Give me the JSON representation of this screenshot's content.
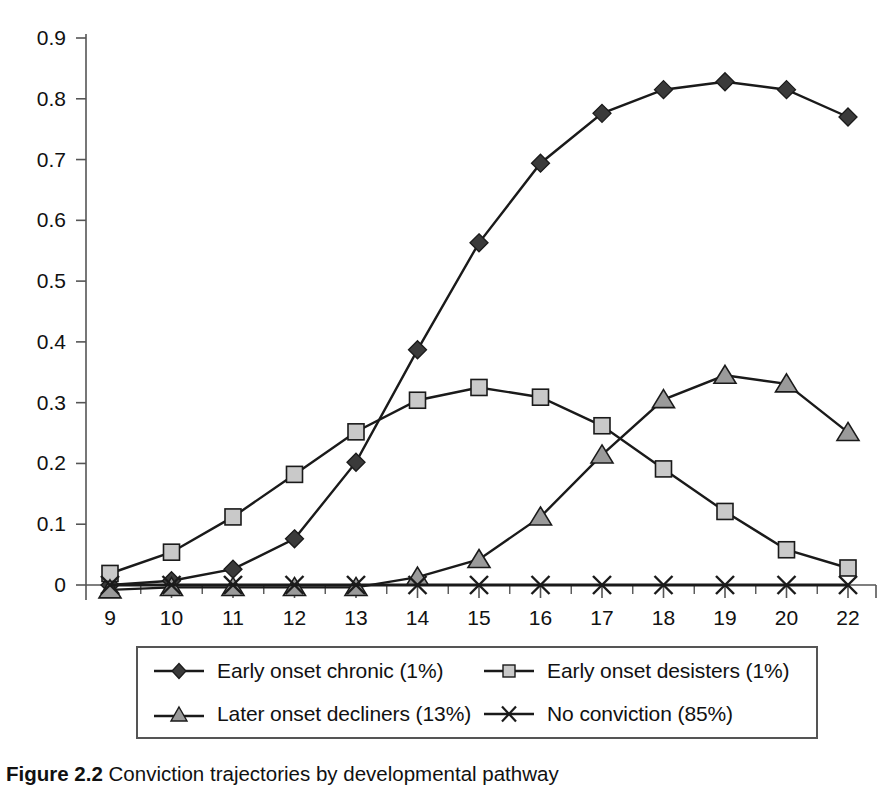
{
  "chart_data": {
    "type": "line",
    "title": "",
    "xlabel": "",
    "ylabel": "",
    "x": [
      9,
      10,
      11,
      12,
      13,
      14,
      15,
      16,
      17,
      18,
      19,
      20,
      22
    ],
    "categories": [
      "9",
      "10",
      "11",
      "12",
      "13",
      "14",
      "15",
      "16",
      "17",
      "18",
      "19",
      "20",
      "22"
    ],
    "xtick_labels": [
      "9",
      "10",
      "11",
      "12",
      "13",
      "14",
      "15",
      "16",
      "17",
      "18",
      "19",
      "20",
      "22"
    ],
    "ytick_labels": [
      "0",
      "0.1",
      "0.2",
      "0.3",
      "0.4",
      "0.5",
      "0.6",
      "0.7",
      "0.8",
      "0.9"
    ],
    "ytick_values": [
      0,
      0.1,
      0.2,
      0.3,
      0.4,
      0.5,
      0.6,
      0.7,
      0.8,
      0.9
    ],
    "ylim": [
      0,
      0.9
    ],
    "grid": false,
    "legend_position": "bottom",
    "series": [
      {
        "name": "Early onset chronic (1%)",
        "marker": "diamond",
        "color": "#3a3a3a",
        "values": [
          0.0,
          0.007,
          0.026,
          0.076,
          0.202,
          0.387,
          0.563,
          0.694,
          0.776,
          0.815,
          0.828,
          0.815,
          0.77
        ]
      },
      {
        "name": "Early onset desisters (1%)",
        "marker": "square",
        "color": "#c9c9c9",
        "values": [
          0.019,
          0.054,
          0.112,
          0.182,
          0.252,
          0.304,
          0.325,
          0.309,
          0.262,
          0.191,
          0.121,
          0.058,
          0.028
        ]
      },
      {
        "name": "Later onset decliners (13%)",
        "marker": "triangle",
        "color": "#9a9a9a",
        "values": [
          -0.008,
          -0.004,
          -0.004,
          -0.004,
          -0.004,
          0.013,
          0.042,
          0.112,
          0.214,
          0.305,
          0.345,
          0.331,
          0.251
        ]
      },
      {
        "name": "No conviction (85%)",
        "marker": "cross",
        "color": "#2a2a2a",
        "values": [
          0.0,
          0.0,
          0.0,
          0.0,
          0.0,
          0.0,
          0.0,
          0.0,
          0.0,
          0.0,
          0.0,
          0.0,
          0.0
        ]
      }
    ]
  },
  "legend": {
    "entries": [
      {
        "label": "Early onset chronic (1%)",
        "marker": "diamond"
      },
      {
        "label": "Early onset desisters (1%)",
        "marker": "square"
      },
      {
        "label": "Later onset decliners (13%)",
        "marker": "triangle"
      },
      {
        "label": "No conviction (85%)",
        "marker": "cross"
      }
    ]
  },
  "caption": {
    "label": "Figure 2.2",
    "text": "Conviction trajectories by developmental pathway"
  },
  "colors": {
    "chronic": "#3a3a3a",
    "desisters": "#c9c9c9",
    "decliners": "#9a9a9a",
    "noconviction": "#2a2a2a",
    "axis": "#555555",
    "line": "#1a1a1a"
  }
}
